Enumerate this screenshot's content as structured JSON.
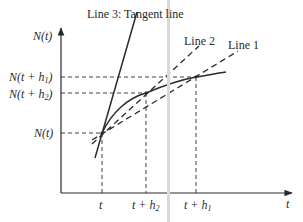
{
  "diagram": {
    "type": "secant-tangent-approximation",
    "y_axis_label": "N(t)",
    "x_axis_label": "t",
    "y_ticks": [
      {
        "id": "n_t_h1",
        "label": "N(t + h",
        "sub": "1",
        "close": ")"
      },
      {
        "id": "n_t_h2",
        "label": "N(t + h",
        "sub": "2",
        "close": ")"
      },
      {
        "id": "n_t",
        "label": "N(t)"
      }
    ],
    "x_ticks": [
      {
        "id": "t",
        "label": "t"
      },
      {
        "id": "t_h2",
        "label": "t + h",
        "sub": "2"
      },
      {
        "id": "t_h1",
        "label": "t + h",
        "sub": "1"
      }
    ],
    "lines": [
      {
        "id": "line3",
        "label": "Line 3: Tangent line",
        "style": "solid"
      },
      {
        "id": "line2",
        "label": "Line 2",
        "style": "dashed"
      },
      {
        "id": "line1",
        "label": "Line 1",
        "style": "dashed"
      }
    ],
    "curve": {
      "label": "N(t)",
      "style": "solid"
    },
    "colors": {
      "ink": "#2a2a2a",
      "stripe": "#d9d9d9",
      "background": "#ffffff"
    }
  }
}
